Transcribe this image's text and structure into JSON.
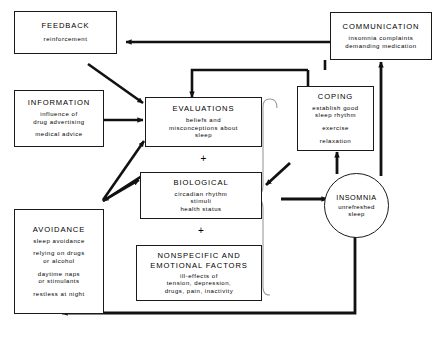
{
  "diagram": {
    "nodes": [
      {
        "id": "feedback",
        "name": "feedback",
        "title": "FEEDBACK",
        "lines": [
          "reinforcement"
        ]
      },
      {
        "id": "information",
        "name": "information",
        "title": "INFORMATION",
        "lines": [
          "influence of",
          "drug advertising",
          "medical advice"
        ]
      },
      {
        "id": "avoidance",
        "name": "avoidance",
        "title": "AVOIDANCE",
        "lines": [
          "sleep avoidance",
          "relying on drugs",
          "or alcohol",
          "daytime naps",
          "or stimulants",
          "restless at night"
        ]
      },
      {
        "id": "evaluations",
        "name": "evaluations",
        "title": "EVALUATIONS",
        "lines": [
          "beliefs and",
          "misconceptions about",
          "sleep"
        ]
      },
      {
        "id": "biological",
        "name": "biological",
        "title": "BIOLOGICAL",
        "lines": [
          "circadian rhythm",
          "stimuli",
          "health status"
        ]
      },
      {
        "id": "nonspecific",
        "name": "nonspecific-and-emotional-factors",
        "title": "NONSPECIFIC AND EMOTIONAL FACTORS",
        "title_line1": "NONSPECIFIC AND",
        "title_line2": "EMOTIONAL FACTORS",
        "lines": [
          "ill-effects of",
          "tension, depression,",
          "drugs, pain, inactivity"
        ]
      },
      {
        "id": "coping",
        "name": "coping",
        "title": "COPING",
        "lines": [
          "establish good",
          "sleep rhythm",
          "exercise",
          "relaxation"
        ]
      },
      {
        "id": "communication",
        "name": "communication",
        "title": "COMMUNICATION",
        "lines": [
          "insomnia complaints",
          "demanding medication"
        ]
      },
      {
        "id": "insomnia",
        "name": "insomnia",
        "title": "INSOMNIA",
        "lines": [
          "unrefreshed",
          "sleep"
        ]
      }
    ],
    "operators": [
      {
        "id": "plus1",
        "symbol": "+"
      },
      {
        "id": "plus2",
        "symbol": "+"
      }
    ],
    "colors": {
      "stroke": "#1a1a1a",
      "background": "#ffffff",
      "brace": "#888888"
    }
  }
}
